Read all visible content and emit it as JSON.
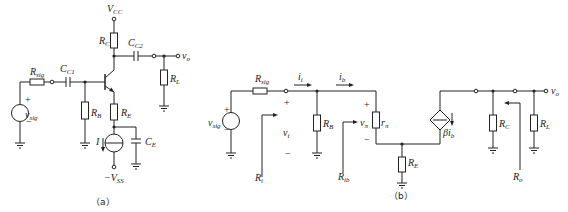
{
  "figure_a": {
    "caption": "（a）",
    "vcc": {
      "main": "V",
      "sub": "CC"
    },
    "vss": {
      "main": "−V",
      "sub": "SS"
    },
    "rc": {
      "main": "R",
      "sub": "C"
    },
    "cc2": {
      "main": "C",
      "sub": "C2"
    },
    "vo": {
      "main": "v",
      "sub": "o"
    },
    "rl": {
      "main": "R",
      "sub": "L"
    },
    "rsig": {
      "main": "R",
      "sub": "sig"
    },
    "cc1": {
      "main": "C",
      "sub": "C1"
    },
    "vsig": {
      "main": "v",
      "sub": "sig"
    },
    "rb": {
      "main": "R",
      "sub": "B"
    },
    "re": {
      "main": "R",
      "sub": "E"
    },
    "ce": {
      "main": "C",
      "sub": "E"
    },
    "i": "I",
    "plus": "+",
    "minus": "−"
  },
  "figure_b": {
    "caption": "（b）",
    "rsig": {
      "main": "R",
      "sub": "sig"
    },
    "ii": {
      "main": "i",
      "sub": "i"
    },
    "ib": {
      "main": "i",
      "sub": "b"
    },
    "vsig": {
      "main": "v",
      "sub": "sig"
    },
    "vi": {
      "main": "v",
      "sub": "i"
    },
    "rb": {
      "main": "R",
      "sub": "B"
    },
    "vpi": {
      "main": "v",
      "sub": "π"
    },
    "rpi": {
      "main": "r",
      "sub": "π"
    },
    "ri": {
      "main": "R",
      "sub": "i"
    },
    "rib": {
      "main": "R",
      "sub": "ib"
    },
    "re": {
      "main": "R",
      "sub": "E"
    },
    "beta_ib": {
      "main": "βi",
      "sub": "b"
    },
    "rc": {
      "main": "R",
      "sub": "C"
    },
    "rl": {
      "main": "R",
      "sub": "L"
    },
    "vo": {
      "main": "v",
      "sub": "o"
    },
    "ro": {
      "main": "R",
      "sub": "o"
    },
    "plus": "+",
    "minus": "−"
  }
}
